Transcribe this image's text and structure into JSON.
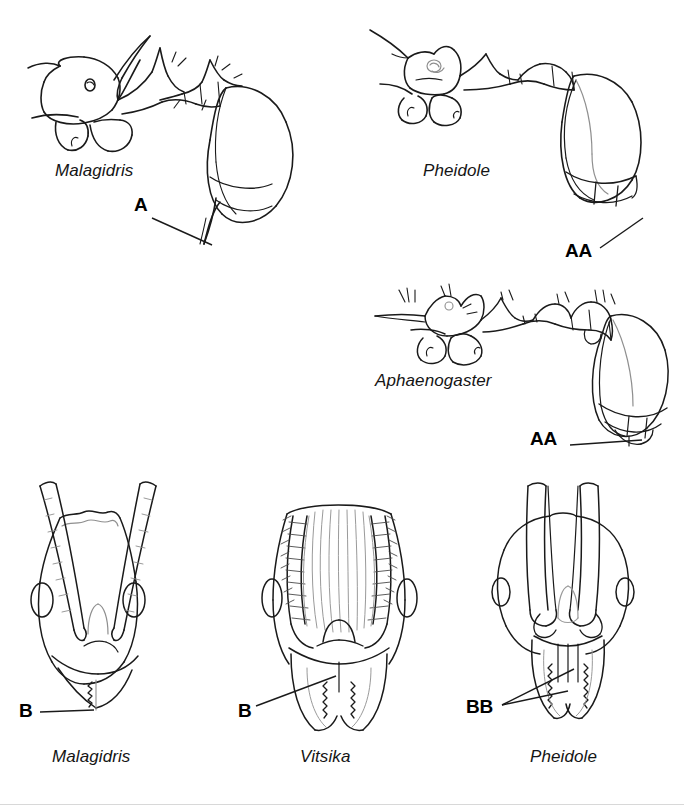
{
  "figure": {
    "background_color": "#ffffff",
    "ink_color": "#1a1a1a",
    "faint_ink_color": "#8f8f8f",
    "caption_style": "italic-genus-names-with-bold-character-callouts"
  },
  "panels": [
    {
      "id": "malagidris-lateral",
      "view": "lateral habitus",
      "genus": "Malagidris",
      "callout": "A",
      "character": "sting long and straight, projecting from gaster apex"
    },
    {
      "id": "pheidole-lateral",
      "view": "lateral habitus",
      "genus": "Pheidole",
      "callout": "AA",
      "character": "sting reduced, gaster apex with overlapping terminal sclerites"
    },
    {
      "id": "aphaenogaster-lateral",
      "view": "lateral habitus",
      "genus": "Aphaenogaster",
      "callout": "AA",
      "character": "sting reduced, gaster apex with overlapping terminal sclerites"
    },
    {
      "id": "malagidris-head",
      "view": "full-face head",
      "genus": "Malagidris",
      "callout": "B",
      "character": "mandible with few teeth on masticatory margin"
    },
    {
      "id": "vitsika-head",
      "view": "full-face head",
      "genus": "Vitsika",
      "callout": "B",
      "character": "mandible with few teeth on masticatory margin"
    },
    {
      "id": "pheidole-head",
      "view": "full-face head",
      "genus": "Pheidole",
      "callout": "BB",
      "character": "mandible with multiple denticles, clypeus with median carinae"
    }
  ],
  "labels": {
    "malagidris_lateral_genus": "Malagidris",
    "malagidris_lateral_callout": "A",
    "pheidole_lateral_genus": "Pheidole",
    "pheidole_lateral_callout": "AA",
    "aphaenogaster_lateral_genus": "Aphaenogaster",
    "aphaenogaster_lateral_callout": "AA",
    "malagidris_head_genus": "Malagidris",
    "malagidris_head_callout": "B",
    "vitsika_head_genus": "Vitsika",
    "vitsika_head_callout": "B",
    "pheidole_head_genus": "Pheidole",
    "pheidole_head_callout": "BB"
  }
}
